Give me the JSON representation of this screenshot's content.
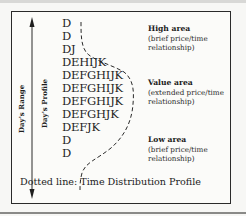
{
  "diagram": {
    "axis_labels": {
      "range": "Day's Range",
      "profile": "Day's Profile"
    },
    "tpo_rows": [
      "D",
      "D",
      "DJ",
      "DEHIJK",
      "DEFGHIJK",
      "DEFGHIJK",
      "DEFGHIJK",
      "DEFGHJK",
      "DEFJK",
      "D",
      "D"
    ],
    "areas": [
      {
        "title": "High area",
        "line1": "(brief price/time",
        "line2": "relationship)"
      },
      {
        "title": "Value area",
        "line1": "(extended price/time",
        "line2": "relationship)"
      },
      {
        "title": "Low area",
        "line1": "(brief price/time",
        "line2": "relationship)"
      }
    ],
    "footer": "Dotted line:  Time Distribution Profile",
    "colors": {
      "ink": "#1e1e1e",
      "frame": "#2a2a2a",
      "background": "#f7f7f5"
    }
  }
}
